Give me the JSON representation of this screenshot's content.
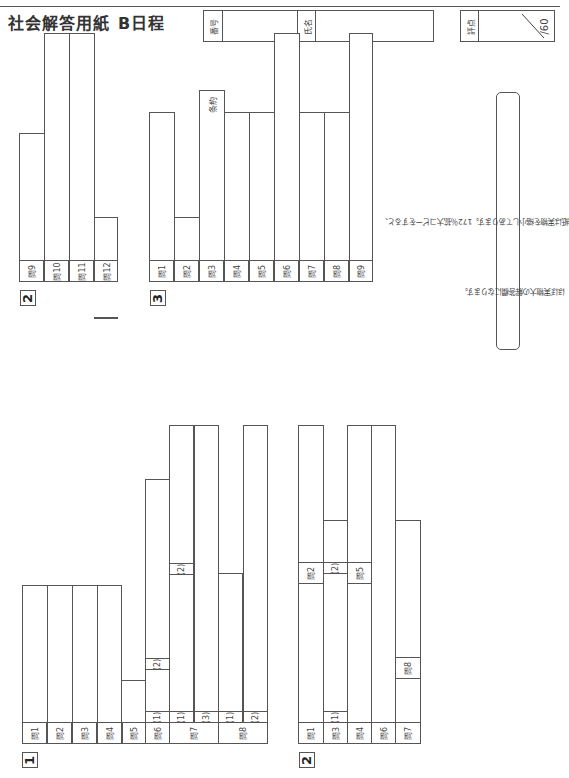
{
  "header": {
    "title": "社会解答用紙",
    "schedule": "B日程",
    "number_label": "番号",
    "name_label": "氏名",
    "score_label": "評点",
    "score_max": "/60"
  },
  "note": {
    "line1": "（注）この解答用紙は実物を縮小してあります。172％拡大コピーをすると、",
    "line2": "ほぼ実物大の解答欄になります。"
  },
  "sections": [
    {
      "number": "1",
      "labels": [
        "問1",
        "問2",
        "問3",
        "問4",
        "問5",
        "問6",
        "問7",
        "問8"
      ],
      "sublabels": {
        "q6": [
          "(1)",
          "(2)"
        ],
        "q7": [
          "(1)",
          "(2)",
          "(3)"
        ],
        "q8": [
          "(1)",
          "(2)"
        ]
      }
    },
    {
      "number": "2",
      "labels": [
        "問1",
        "問2",
        "問3",
        "問4",
        "問5",
        "問6",
        "問7",
        "問8",
        "問9",
        "問10",
        "問11",
        "問12"
      ],
      "sublabels": {
        "q3": [
          "(1)",
          "(2)"
        ]
      }
    },
    {
      "number": "3",
      "labels": [
        "問1",
        "問2",
        "問3",
        "問4",
        "問5",
        "問6",
        "問7",
        "問8",
        "問9"
      ],
      "q3_extra": "条約"
    }
  ]
}
